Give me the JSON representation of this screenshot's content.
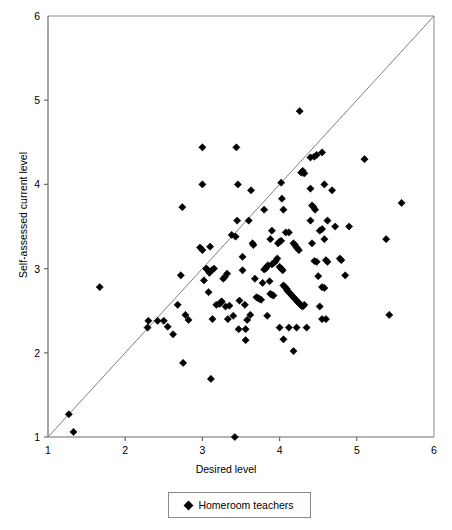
{
  "chart_data": {
    "type": "scatter",
    "title": "",
    "xlabel": "Desired level",
    "ylabel": "Self-assessed current level",
    "xlim": [
      1,
      6
    ],
    "ylim": [
      1,
      6
    ],
    "xticks": [
      1,
      2,
      3,
      4,
      5,
      6
    ],
    "yticks": [
      1,
      2,
      3,
      4,
      5,
      6
    ],
    "grid": false,
    "legend": {
      "position": "below-axes",
      "entries": [
        {
          "name": "Homeroom teachers",
          "marker": "diamond",
          "color": "#000000"
        }
      ]
    },
    "annotations": [
      {
        "type": "reference-line",
        "description": "identity line y = x",
        "from": [
          1,
          1
        ],
        "to": [
          6,
          6
        ],
        "color": "#808080"
      }
    ],
    "series": [
      {
        "name": "Homeroom teachers",
        "marker": "diamond",
        "color": "#000000",
        "points": [
          [
            1.27,
            1.27
          ],
          [
            1.33,
            1.06
          ],
          [
            3.42,
            1.0
          ],
          [
            1.67,
            2.78
          ],
          [
            2.29,
            2.3
          ],
          [
            2.3,
            2.38
          ],
          [
            2.5,
            2.38
          ],
          [
            2.55,
            2.31
          ],
          [
            2.62,
            2.22
          ],
          [
            2.68,
            2.57
          ],
          [
            2.72,
            2.92
          ],
          [
            2.75,
            1.88
          ],
          [
            2.74,
            3.73
          ],
          [
            2.78,
            2.45
          ],
          [
            2.82,
            2.39
          ],
          [
            2.97,
            3.25
          ],
          [
            3.0,
            3.22
          ],
          [
            3.0,
            4.0
          ],
          [
            3.0,
            4.44
          ],
          [
            3.02,
            2.86
          ],
          [
            3.05,
            3.0
          ],
          [
            3.06,
            2.99
          ],
          [
            3.07,
            2.98
          ],
          [
            3.09,
            2.95
          ],
          [
            3.1,
            3.26
          ],
          [
            3.08,
            2.72
          ],
          [
            3.11,
            1.69
          ],
          [
            3.13,
            2.4
          ],
          [
            3.18,
            2.57
          ],
          [
            3.22,
            2.58
          ],
          [
            3.24,
            2.6
          ],
          [
            3.25,
            2.61
          ],
          [
            3.27,
            2.88
          ],
          [
            3.29,
            2.9
          ],
          [
            3.32,
            2.94
          ],
          [
            3.33,
            2.4
          ],
          [
            3.38,
            3.4
          ],
          [
            3.43,
            3.38
          ],
          [
            3.45,
            3.57
          ],
          [
            3.46,
            4.0
          ],
          [
            3.44,
            4.44
          ],
          [
            3.4,
            2.44
          ],
          [
            3.47,
            2.28
          ],
          [
            3.52,
            3.14
          ],
          [
            3.55,
            2.57
          ],
          [
            3.56,
            2.15
          ],
          [
            3.58,
            2.39
          ],
          [
            3.6,
            3.57
          ],
          [
            3.63,
            3.93
          ],
          [
            3.65,
            3.3
          ],
          [
            3.66,
            3.28
          ],
          [
            3.68,
            2.88
          ],
          [
            3.7,
            2.66
          ],
          [
            3.72,
            2.65
          ],
          [
            3.74,
            2.64
          ],
          [
            3.76,
            2.63
          ],
          [
            3.78,
            2.83
          ],
          [
            3.8,
            2.99
          ],
          [
            3.82,
            3.0
          ],
          [
            3.83,
            3.02
          ],
          [
            3.85,
            3.04
          ],
          [
            3.87,
            2.85
          ],
          [
            3.88,
            2.7
          ],
          [
            3.9,
            2.69
          ],
          [
            3.92,
            2.68
          ],
          [
            3.9,
            3.05
          ],
          [
            3.93,
            3.07
          ],
          [
            3.95,
            3.09
          ],
          [
            3.97,
            3.12
          ],
          [
            3.98,
            3.3
          ],
          [
            4.0,
            3.32
          ],
          [
            4.02,
            3.33
          ],
          [
            4.0,
            3.02
          ],
          [
            4.02,
            3.0
          ],
          [
            4.04,
            2.98
          ],
          [
            4.05,
            2.8
          ],
          [
            4.07,
            2.78
          ],
          [
            4.09,
            2.76
          ],
          [
            4.1,
            2.74
          ],
          [
            4.12,
            2.72
          ],
          [
            4.14,
            2.7
          ],
          [
            4.16,
            2.68
          ],
          [
            4.18,
            2.66
          ],
          [
            4.2,
            2.64
          ],
          [
            4.22,
            2.62
          ],
          [
            4.24,
            2.6
          ],
          [
            4.26,
            2.58
          ],
          [
            4.28,
            2.56
          ],
          [
            4.05,
            3.7
          ],
          [
            4.03,
            3.83
          ],
          [
            4.02,
            4.02
          ],
          [
            3.8,
            3.7
          ],
          [
            3.88,
            3.35
          ],
          [
            3.9,
            3.45
          ],
          [
            4.08,
            3.43
          ],
          [
            4.12,
            3.43
          ],
          [
            4.18,
            3.3
          ],
          [
            4.2,
            3.28
          ],
          [
            4.22,
            3.25
          ],
          [
            4.25,
            3.22
          ],
          [
            4.28,
            4.14
          ],
          [
            4.3,
            4.16
          ],
          [
            4.32,
            4.13
          ],
          [
            4.26,
            4.87
          ],
          [
            4.4,
            4.32
          ],
          [
            4.45,
            4.33
          ],
          [
            4.48,
            4.35
          ],
          [
            4.55,
            4.38
          ],
          [
            4.4,
            3.95
          ],
          [
            4.42,
            3.75
          ],
          [
            4.44,
            3.73
          ],
          [
            4.46,
            3.7
          ],
          [
            4.4,
            3.57
          ],
          [
            4.42,
            3.3
          ],
          [
            4.45,
            3.09
          ],
          [
            4.48,
            3.08
          ],
          [
            4.52,
            3.45
          ],
          [
            4.55,
            3.47
          ],
          [
            4.58,
            3.35
          ],
          [
            4.6,
            3.1
          ],
          [
            4.62,
            3.08
          ],
          [
            4.5,
            2.91
          ],
          [
            4.55,
            2.78
          ],
          [
            4.58,
            2.77
          ],
          [
            4.52,
            2.55
          ],
          [
            4.55,
            2.4
          ],
          [
            4.6,
            2.4
          ],
          [
            4.68,
            3.93
          ],
          [
            4.72,
            3.5
          ],
          [
            4.78,
            3.12
          ],
          [
            4.8,
            3.1
          ],
          [
            4.85,
            2.92
          ],
          [
            4.35,
            2.3
          ],
          [
            4.22,
            2.3
          ],
          [
            4.12,
            2.3
          ],
          [
            4.05,
            2.16
          ],
          [
            4.18,
            2.02
          ],
          [
            4.0,
            2.3
          ],
          [
            3.84,
            2.44
          ],
          [
            3.62,
            2.45
          ],
          [
            3.56,
            2.28
          ],
          [
            4.3,
            2.55
          ],
          [
            4.32,
            2.57
          ],
          [
            5.1,
            4.3
          ],
          [
            5.38,
            3.35
          ],
          [
            5.42,
            2.45
          ],
          [
            5.58,
            3.78
          ],
          [
            4.9,
            3.5
          ],
          [
            4.62,
            3.57
          ],
          [
            4.58,
            4.0
          ],
          [
            2.42,
            2.38
          ],
          [
            3.12,
            2.98
          ],
          [
            3.15,
            3.0
          ],
          [
            3.52,
            2.98
          ],
          [
            3.48,
            2.62
          ],
          [
            3.3,
            2.55
          ],
          [
            3.35,
            2.56
          ]
        ]
      }
    ]
  },
  "legend_box": {
    "label": "Homeroom teachers",
    "marker_name": "diamond-marker"
  },
  "axes": {
    "x_title": "Desired level",
    "y_title": "Self-assessed current level"
  }
}
